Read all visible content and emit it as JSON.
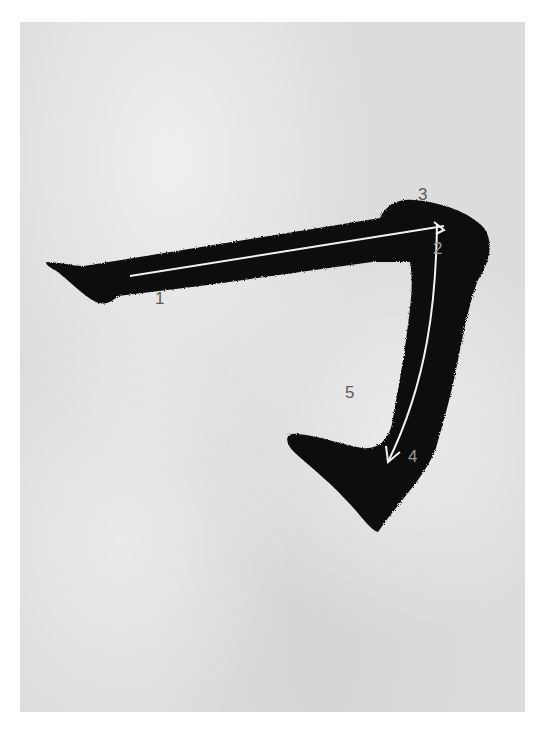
{
  "diagram": {
    "background_color": "#dcdcdc",
    "ink_color": "#111111",
    "guide_line_color": "#f2f2f2",
    "labels": [
      {
        "id": "1",
        "text": "1"
      },
      {
        "id": "2",
        "text": "2"
      },
      {
        "id": "3",
        "text": "3"
      },
      {
        "id": "4",
        "text": "4"
      },
      {
        "id": "5",
        "text": "5"
      }
    ]
  }
}
